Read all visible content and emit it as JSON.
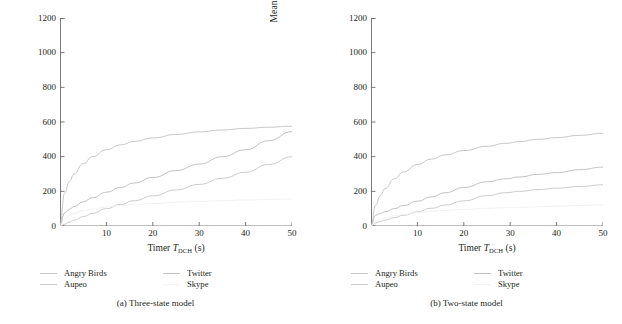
{
  "figure": {
    "ylabel": "Mean power consumption (mW)",
    "xlabel_prefix": "Timer ",
    "xlabel_symbol": "T",
    "xlabel_subscript": "DCH",
    "xlabel_suffix": " (s)",
    "yticks": [
      "1200",
      "1000",
      "800",
      "600",
      "400",
      "200",
      "0"
    ],
    "xticks": [
      "10",
      "20",
      "30",
      "40",
      "50"
    ],
    "legend": [
      {
        "label": "Angry Birds",
        "color": "#c8c8c8"
      },
      {
        "label": "Twitter",
        "color": "#c2c2c2"
      },
      {
        "label": "Aupeo",
        "color": "#cccccc"
      },
      {
        "label": "Skype",
        "color": "#f2f2f2"
      }
    ],
    "panels": [
      {
        "caption": "(a) Three-state model"
      },
      {
        "caption": "(b) Two-state model"
      }
    ]
  },
  "chart_data": [
    {
      "type": "line",
      "title": "(a) Three-state model",
      "xlabel": "Timer T_DCH (s)",
      "ylabel": "Mean power consumption (mW)",
      "xlim": [
        0,
        50
      ],
      "ylim": [
        0,
        1200
      ],
      "xticks": [
        0,
        10,
        20,
        30,
        40,
        50
      ],
      "yticks": [
        0,
        200,
        400,
        600,
        800,
        1000,
        1200
      ],
      "grid": false,
      "legend_position": "below",
      "x": [
        0,
        1,
        2,
        3,
        5,
        7,
        10,
        13,
        16,
        20,
        25,
        30,
        35,
        40,
        45,
        50
      ],
      "series": [
        {
          "name": "Angry Birds",
          "color": "#c8c8c8",
          "values": [
            0,
            190,
            255,
            300,
            360,
            400,
            440,
            468,
            488,
            508,
            528,
            543,
            554,
            563,
            570,
            576
          ]
        },
        {
          "name": "Twitter",
          "color": "#c2c2c2",
          "values": [
            0,
            75,
            95,
            112,
            140,
            163,
            195,
            222,
            248,
            280,
            320,
            357,
            400,
            440,
            492,
            545
          ]
        },
        {
          "name": "Aupeo",
          "color": "#cccccc",
          "values": [
            0,
            10,
            22,
            33,
            54,
            73,
            100,
            124,
            146,
            174,
            208,
            240,
            275,
            310,
            355,
            400
          ]
        },
        {
          "name": "Skype",
          "color": "#f2f2f2",
          "values": [
            0,
            40,
            60,
            72,
            88,
            98,
            110,
            118,
            124,
            130,
            137,
            142,
            146,
            150,
            153,
            156
          ]
        }
      ]
    },
    {
      "type": "line",
      "title": "(b) Two-state model",
      "xlabel": "Timer T_DCH (s)",
      "ylabel": "Mean power consumption (mW)",
      "xlim": [
        0,
        50
      ],
      "ylim": [
        0,
        1200
      ],
      "xticks": [
        0,
        10,
        20,
        30,
        40,
        50
      ],
      "yticks": [
        0,
        200,
        400,
        600,
        800,
        1000,
        1200
      ],
      "grid": false,
      "legend_position": "below",
      "x": [
        0,
        1,
        2,
        3,
        5,
        7,
        10,
        13,
        16,
        20,
        25,
        29,
        32,
        36,
        40,
        45,
        50
      ],
      "series": [
        {
          "name": "Angry Birds",
          "color": "#c8c8c8",
          "values": [
            0,
            120,
            175,
            215,
            272,
            312,
            355,
            386,
            410,
            435,
            460,
            477,
            487,
            500,
            510,
            523,
            535
          ]
        },
        {
          "name": "Twitter",
          "color": "#c2c2c2",
          "values": [
            0,
            62,
            72,
            82,
            100,
            118,
            143,
            168,
            192,
            222,
            255,
            272,
            283,
            298,
            308,
            325,
            340
          ]
        },
        {
          "name": "Aupeo",
          "color": "#cccccc",
          "values": [
            0,
            18,
            26,
            34,
            48,
            62,
            82,
            102,
            121,
            145,
            175,
            192,
            200,
            210,
            218,
            228,
            238
          ]
        },
        {
          "name": "Skype",
          "color": "#f2f2f2",
          "values": [
            0,
            28,
            40,
            48,
            60,
            68,
            78,
            85,
            90,
            96,
            102,
            106,
            108,
            111,
            114,
            118,
            122
          ]
        }
      ]
    }
  ]
}
